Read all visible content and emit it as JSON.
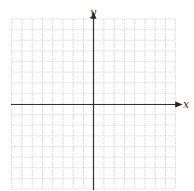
{
  "chart_data": {
    "type": "line",
    "title": "",
    "xlabel": "x",
    "ylabel": "y",
    "series": [],
    "grid": true,
    "grid_cells_x": 16,
    "grid_cells_y": 16,
    "xlim": [
      -8,
      8
    ],
    "ylim": [
      -8,
      8
    ],
    "x_ticks_labeled": false,
    "y_ticks_labeled": false,
    "legend": "none",
    "colors": {
      "grid": "#c8c8c8",
      "axis": "#333333"
    }
  },
  "labels": {
    "x_axis": "x",
    "y_axis": "y"
  }
}
